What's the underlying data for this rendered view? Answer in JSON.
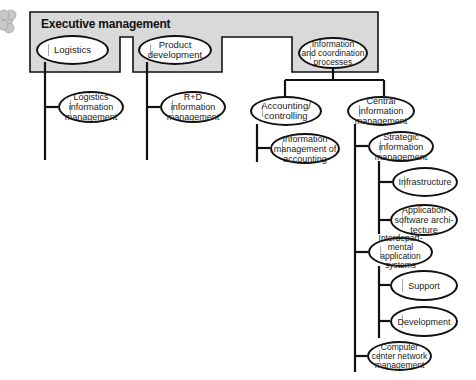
{
  "diagram": {
    "type": "org-chart",
    "frame": {
      "title": "Executive management",
      "fill": "#d9d9d9"
    },
    "colors": {
      "line": "#111111",
      "frame_fill": "#d9d9d9",
      "cloud_fill": "#c8c8c8"
    },
    "nodes": {
      "logistics": "Logistics",
      "product_development": "Product\ndevelopment",
      "info_coordination": "Information\nand coordination\nprocesses",
      "logistics_info_mgmt": "Logistics\ninformation\nmanagement",
      "rd_info_mgmt": "R+D\ninformation\nmanagement",
      "accounting": "Accounting/\ncontrolling",
      "central_info_mgmt": "Central\ninformation\nmanagement",
      "info_mgmt_accounting": "Information\nmanagement of\naccounting",
      "strategic_info_mgmt": "Strategic\ninformation\nmanagement",
      "infrastructure": "Infrastructure",
      "app_software_arch": "Application\nsoftware archi-\ntecture",
      "interdepartmental": "Interdepart-\nmental application\nsystems",
      "support": "Support",
      "development": "Development",
      "computer_center": "Computer\ncenter network\nmanagement"
    }
  }
}
